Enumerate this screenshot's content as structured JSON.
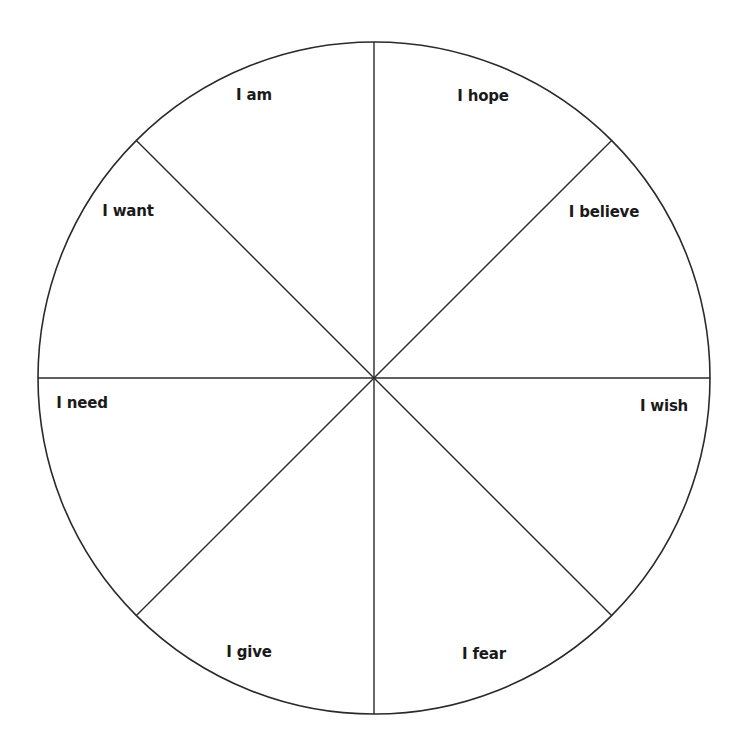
{
  "diagram": {
    "type": "feelings-wheel",
    "center": [
      374,
      378
    ],
    "radius": 336,
    "stroke_color": "#2a2a2a",
    "background": "#ffffff",
    "segments": [
      {
        "label": "I am",
        "x": 254,
        "y": 95
      },
      {
        "label": "I hope",
        "x": 483,
        "y": 96
      },
      {
        "label": "I believe",
        "x": 604,
        "y": 212
      },
      {
        "label": "I wish",
        "x": 664,
        "y": 406
      },
      {
        "label": "I fear",
        "x": 484,
        "y": 654
      },
      {
        "label": "I give",
        "x": 249,
        "y": 652
      },
      {
        "label": "I need",
        "x": 82,
        "y": 403
      },
      {
        "label": "I want",
        "x": 128,
        "y": 211
      }
    ]
  }
}
